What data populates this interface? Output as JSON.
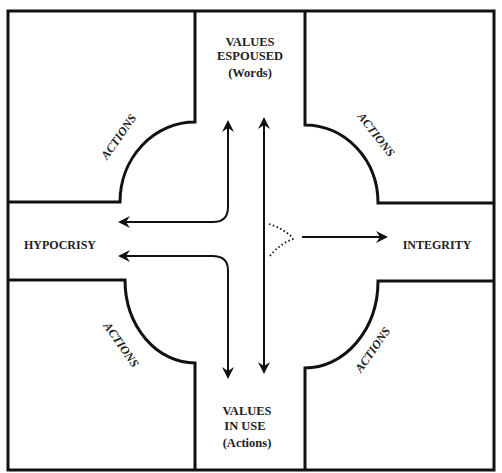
{
  "diagram": {
    "top": {
      "line1": "VALUES",
      "line2": "ESPOUSED",
      "line3": "(Words)"
    },
    "bottom": {
      "line1": "VALUES",
      "line2": "IN USE",
      "line3": "(Actions)"
    },
    "left": "HYPOCRISY",
    "right": "INTEGRITY",
    "corners": {
      "top_left": "ACTIONS",
      "top_right": "ACTIONS",
      "bottom_left": "ACTIONS",
      "bottom_right": "ACTIONS"
    },
    "colors": {
      "line": "#111111",
      "text": "#222222",
      "background": "#ffffff"
    }
  }
}
